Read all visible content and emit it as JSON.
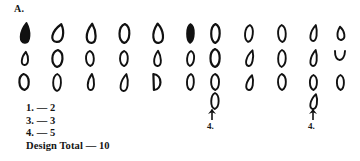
{
  "figure": {
    "panel_label": "A.",
    "ink_color": "#111111",
    "background_color": "#ffffff"
  },
  "legend": {
    "rows": [
      {
        "key": "1.",
        "dash": "—",
        "value": "2",
        "text": "1. — 2"
      },
      {
        "key": "3.",
        "dash": "—",
        "value": "3",
        "text": "3. — 3"
      },
      {
        "key": "4.",
        "dash": "—",
        "value": "5",
        "text": "4. — 5"
      }
    ],
    "total": {
      "label": "Design Total",
      "dash": "—",
      "value": "10",
      "text": "Design Total — 10"
    }
  },
  "annotations": [
    {
      "name": "arrow-annotation-left",
      "icon": "up-arrow-icon",
      "label": "4.",
      "x": 212,
      "y": 108
    },
    {
      "name": "arrow-annotation-right",
      "icon": "up-arrow-icon",
      "label": "4.",
      "x": 313,
      "y": 108
    }
  ],
  "grid": {
    "rows": 3,
    "columns": 11,
    "column_x": [
      24,
      57,
      90,
      124,
      157,
      190,
      215,
      249,
      282,
      313,
      340
    ],
    "row_y": [
      33,
      58,
      82
    ],
    "extra_row_y": [
      100,
      100
    ]
  },
  "glyphs": [
    {
      "id": "r1c1",
      "row": 1,
      "col": 1,
      "x": 24,
      "y": 33,
      "w": 13,
      "h": 20,
      "fill": "solid",
      "rot": -4,
      "shape": "teardrop"
    },
    {
      "id": "r1c2",
      "row": 1,
      "col": 2,
      "x": 57,
      "y": 33,
      "w": 15,
      "h": 18,
      "fill": "hollow",
      "rot": 4,
      "shape": "teardrop"
    },
    {
      "id": "r1c3",
      "row": 1,
      "col": 3,
      "x": 90,
      "y": 33,
      "w": 13,
      "h": 19,
      "fill": "hollow",
      "rot": -6,
      "shape": "teardrop"
    },
    {
      "id": "r1c4",
      "row": 1,
      "col": 4,
      "x": 124,
      "y": 33,
      "w": 13,
      "h": 19,
      "fill": "hollow",
      "rot": 2,
      "shape": "oval"
    },
    {
      "id": "r1c5",
      "row": 1,
      "col": 5,
      "x": 157,
      "y": 33,
      "w": 14,
      "h": 19,
      "fill": "hollow",
      "rot": -14,
      "shape": "teardrop"
    },
    {
      "id": "r1c6",
      "row": 1,
      "col": 6,
      "x": 190,
      "y": 33,
      "w": 9,
      "h": 19,
      "fill": "solid",
      "rot": 0,
      "shape": "oval"
    },
    {
      "id": "r1c7",
      "row": 1,
      "col": 7,
      "x": 215,
      "y": 33,
      "w": 11,
      "h": 19,
      "fill": "hollow",
      "rot": 0,
      "shape": "oval"
    },
    {
      "id": "r1c8",
      "row": 1,
      "col": 8,
      "x": 249,
      "y": 33,
      "w": 10,
      "h": 17,
      "fill": "hollow",
      "rot": 6,
      "shape": "oval"
    },
    {
      "id": "r1c9",
      "row": 1,
      "col": 9,
      "x": 282,
      "y": 33,
      "w": 10,
      "h": 17,
      "fill": "hollow",
      "rot": -2,
      "shape": "oval"
    },
    {
      "id": "r1c10",
      "row": 1,
      "col": 10,
      "x": 313,
      "y": 33,
      "w": 9,
      "h": 16,
      "fill": "hollow",
      "rot": 3,
      "shape": "teardrop"
    },
    {
      "id": "r1c11",
      "row": 1,
      "col": 11,
      "x": 340,
      "y": 33,
      "w": 10,
      "h": 13,
      "fill": "hollow",
      "rot": -18,
      "shape": "teardrop"
    },
    {
      "id": "r2c1",
      "row": 2,
      "col": 1,
      "x": 24,
      "y": 58,
      "w": 9,
      "h": 13,
      "fill": "hollow",
      "rot": -5,
      "shape": "teardrop"
    },
    {
      "id": "r2c2",
      "row": 2,
      "col": 2,
      "x": 57,
      "y": 58,
      "w": 13,
      "h": 17,
      "fill": "hollow",
      "rot": 3,
      "shape": "oval"
    },
    {
      "id": "r2c3",
      "row": 2,
      "col": 3,
      "x": 90,
      "y": 58,
      "w": 10,
      "h": 15,
      "fill": "hollow",
      "rot": -2,
      "shape": "oval"
    },
    {
      "id": "r2c4",
      "row": 2,
      "col": 4,
      "x": 124,
      "y": 58,
      "w": 10,
      "h": 15,
      "fill": "hollow",
      "rot": 2,
      "shape": "oval"
    },
    {
      "id": "r2c5",
      "row": 2,
      "col": 5,
      "x": 157,
      "y": 58,
      "w": 10,
      "h": 15,
      "fill": "hollow",
      "rot": -8,
      "shape": "teardrop"
    },
    {
      "id": "r2c6",
      "row": 2,
      "col": 6,
      "x": 190,
      "y": 58,
      "w": 9,
      "h": 15,
      "fill": "hollow",
      "rot": 4,
      "shape": "oval"
    },
    {
      "id": "r2c7",
      "row": 2,
      "col": 7,
      "x": 215,
      "y": 58,
      "w": 12,
      "h": 18,
      "fill": "hollow",
      "rot": 0,
      "shape": "oval"
    },
    {
      "id": "r2c8",
      "row": 2,
      "col": 8,
      "x": 249,
      "y": 58,
      "w": 9,
      "h": 16,
      "fill": "hollow",
      "rot": 8,
      "shape": "teardrop"
    },
    {
      "id": "r2c9",
      "row": 2,
      "col": 9,
      "x": 282,
      "y": 58,
      "w": 10,
      "h": 17,
      "fill": "hollow",
      "rot": 0,
      "shape": "oval"
    },
    {
      "id": "r2c10",
      "row": 2,
      "col": 10,
      "x": 313,
      "y": 58,
      "w": 9,
      "h": 16,
      "fill": "hollow",
      "rot": 2,
      "shape": "teardrop"
    },
    {
      "id": "r2c11",
      "row": 2,
      "col": 11,
      "x": 340,
      "y": 58,
      "w": 10,
      "h": 14,
      "fill": "hollow",
      "rot": 0,
      "shape": "u-shape"
    },
    {
      "id": "r3c1",
      "row": 3,
      "col": 1,
      "x": 24,
      "y": 82,
      "w": 12,
      "h": 16,
      "fill": "hollow",
      "rot": -3,
      "shape": "oval"
    },
    {
      "id": "r3c2",
      "row": 3,
      "col": 2,
      "x": 57,
      "y": 82,
      "w": 10,
      "h": 17,
      "fill": "hollow",
      "rot": 2,
      "shape": "oval"
    },
    {
      "id": "r3c3",
      "row": 3,
      "col": 3,
      "x": 90,
      "y": 82,
      "w": 9,
      "h": 16,
      "fill": "hollow",
      "rot": -3,
      "shape": "teardrop"
    },
    {
      "id": "r3c4",
      "row": 3,
      "col": 4,
      "x": 124,
      "y": 82,
      "w": 10,
      "h": 17,
      "fill": "hollow",
      "rot": 2,
      "shape": "teardrop"
    },
    {
      "id": "r3c5",
      "row": 3,
      "col": 5,
      "x": 157,
      "y": 82,
      "w": 11,
      "h": 16,
      "fill": "hollow",
      "rot": 0,
      "shape": "d-shape"
    },
    {
      "id": "r3c6",
      "row": 3,
      "col": 6,
      "x": 190,
      "y": 82,
      "w": 9,
      "h": 16,
      "fill": "hollow",
      "rot": 3,
      "shape": "oval"
    },
    {
      "id": "r3c7",
      "row": 3,
      "col": 7,
      "x": 215,
      "y": 82,
      "w": 10,
      "h": 16,
      "fill": "hollow",
      "rot": 0,
      "shape": "oval"
    },
    {
      "id": "r3c8",
      "row": 3,
      "col": 8,
      "x": 249,
      "y": 82,
      "w": 9,
      "h": 15,
      "fill": "hollow",
      "rot": 5,
      "shape": "teardrop"
    },
    {
      "id": "r3c9",
      "row": 3,
      "col": 9,
      "x": 282,
      "y": 82,
      "w": 10,
      "h": 16,
      "fill": "hollow",
      "rot": -2,
      "shape": "oval"
    },
    {
      "id": "r3c10",
      "row": 3,
      "col": 10,
      "x": 313,
      "y": 82,
      "w": 9,
      "h": 15,
      "fill": "hollow",
      "rot": 0,
      "shape": "oval"
    },
    {
      "id": "r3c11",
      "row": 3,
      "col": 11,
      "x": 340,
      "y": 82,
      "w": 9,
      "h": 15,
      "fill": "hollow",
      "rot": 0,
      "shape": "oval"
    },
    {
      "id": "r4c7",
      "row": 4,
      "col": 7,
      "x": 215,
      "y": 101,
      "w": 10,
      "h": 16,
      "fill": "hollow",
      "rot": 0,
      "shape": "oval"
    },
    {
      "id": "r4c10",
      "row": 4,
      "col": 10,
      "x": 313,
      "y": 101,
      "w": 9,
      "h": 15,
      "fill": "hollow",
      "rot": 4,
      "shape": "teardrop"
    }
  ]
}
